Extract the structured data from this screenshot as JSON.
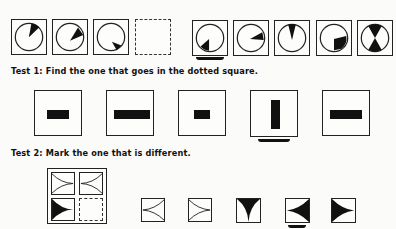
{
  "page": {
    "heading_cropped": true
  },
  "example": {
    "description": "Sequence of rotating wedge circles with dotted missing square and five answer options",
    "stimulus": [
      {
        "type": "circle-wedge",
        "wedge_angle_deg": 10
      },
      {
        "type": "circle-wedge",
        "wedge_angle_deg": 60
      },
      {
        "type": "circle-wedge",
        "wedge_angle_deg": 120
      },
      {
        "type": "missing",
        "style": "dotted"
      }
    ],
    "options": [
      {
        "type": "circle-wedge",
        "wedge_angle_deg": 225,
        "marked": true
      },
      {
        "type": "circle-wedge",
        "wedge_angle_deg": 85,
        "marked": false
      },
      {
        "type": "circle-wedge",
        "wedge_angle_deg": 0,
        "marked": false
      },
      {
        "type": "circle-wedge",
        "wedge_angle_deg": 150,
        "marked": false
      },
      {
        "type": "circle-hourglass",
        "marked": false
      }
    ]
  },
  "test1": {
    "label": "Test 1: Find the one that goes in the dotted square.",
    "options": [
      {
        "type": "bar",
        "orientation": "horizontal",
        "size": "medium",
        "marked": false
      },
      {
        "type": "bar",
        "orientation": "horizontal",
        "size": "long",
        "marked": false
      },
      {
        "type": "bar",
        "orientation": "horizontal",
        "size": "small",
        "marked": false
      },
      {
        "type": "bar",
        "orientation": "vertical",
        "size": "long",
        "marked": true
      },
      {
        "type": "bar",
        "orientation": "horizontal",
        "size": "long",
        "marked": false
      }
    ]
  },
  "test2": {
    "label": "Test 2: Mark the one that is different.",
    "matrix": [
      {
        "type": "curved-arrow-outline",
        "direction": "right"
      },
      {
        "type": "curved-arrow-outline",
        "direction": "left"
      },
      {
        "type": "curved-arrow-filled",
        "direction": "right"
      },
      {
        "type": "missing",
        "style": "dotted"
      }
    ],
    "options": [
      {
        "type": "curved-arrow-outline",
        "direction": "left",
        "marked": false
      },
      {
        "type": "curved-arrow-outline",
        "direction": "right",
        "marked": false
      },
      {
        "type": "curved-arrow-filled",
        "direction": "down",
        "marked": false
      },
      {
        "type": "curved-arrow-filled",
        "direction": "left",
        "marked": true
      },
      {
        "type": "curved-arrow-filled",
        "direction": "right",
        "marked": false
      }
    ]
  }
}
